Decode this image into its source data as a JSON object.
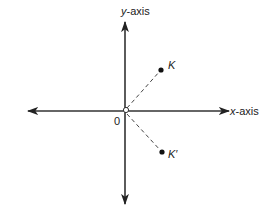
{
  "diagram": {
    "type": "coordinate-plane",
    "origin_label": "0",
    "x_axis": {
      "label_var": "x",
      "label_rest": "-axis"
    },
    "y_axis": {
      "label_var": "y",
      "label_rest": "-axis"
    },
    "points": [
      {
        "name": "K",
        "label": "K",
        "quadrant": "I"
      },
      {
        "name": "K-prime",
        "label": "K′",
        "quadrant": "IV"
      }
    ],
    "segments": [
      {
        "from": "origin",
        "to": "K",
        "style": "dashed"
      },
      {
        "from": "origin",
        "to": "K′",
        "style": "dashed"
      }
    ],
    "colors": {
      "ink": "#222222",
      "background": "#ffffff"
    }
  }
}
